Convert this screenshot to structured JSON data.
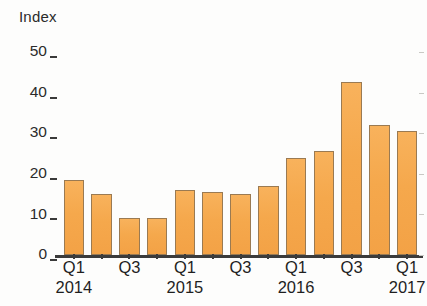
{
  "chart_data": {
    "type": "bar",
    "title": "",
    "subtitle": "",
    "xlabel": "",
    "ylabel": "Index",
    "ylim": [
      0,
      50
    ],
    "yticks": [
      0,
      10,
      20,
      30,
      40,
      50
    ],
    "ytick_labels": [
      "0",
      "10",
      "20",
      "30",
      "40",
      "50"
    ],
    "grid": false,
    "legend": null,
    "bar_color": "#F5A84C",
    "bar_edge_color": "#9A7A52",
    "axis_color": "#3B3B3B",
    "categories": [
      "Q1 2014",
      "Q2 2014",
      "Q3 2014",
      "Q4 2014",
      "Q1 2015",
      "Q2 2015",
      "Q3 2015",
      "Q4 2015",
      "Q1 2016",
      "Q2 2016",
      "Q3 2016",
      "Q4 2016",
      "Q1 2017"
    ],
    "values": [
      18.5,
      15,
      9,
      9,
      16,
      15.5,
      15,
      17,
      24,
      25.5,
      42.5,
      32,
      30.5
    ],
    "xtick_labels": [
      {
        "quarter": "Q1",
        "year": "2014",
        "index": 0
      },
      {
        "quarter": "Q3",
        "year": "",
        "index": 2
      },
      {
        "quarter": "Q1",
        "year": "2015",
        "index": 4
      },
      {
        "quarter": "Q3",
        "year": "",
        "index": 6
      },
      {
        "quarter": "Q1",
        "year": "2016",
        "index": 8
      },
      {
        "quarter": "Q3",
        "year": "",
        "index": 10
      },
      {
        "quarter": "Q1",
        "year": "2017",
        "index": 12
      }
    ]
  }
}
